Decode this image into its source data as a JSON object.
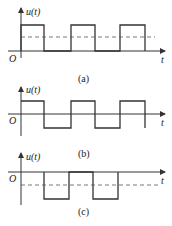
{
  "figure": {
    "panels": [
      {
        "id": "a",
        "caption": "(a)",
        "y_label": "u(t)",
        "x_label": "t",
        "origin_label": "O",
        "description": "Unipolar rectangular pulse train above zero; dashed line shows positive DC (average) level",
        "waveform": "pulses from 0 to +A",
        "dashed_level": "positive average"
      },
      {
        "id": "b",
        "caption": "(b)",
        "y_label": "u(t)",
        "x_label": "t",
        "origin_label": "O",
        "description": "Bipolar square wave alternating between +A and -A with zero average",
        "waveform": "square wave +A / -A",
        "dashed_level": "none"
      },
      {
        "id": "c",
        "caption": "(c)",
        "y_label": "u(t)",
        "x_label": "t",
        "origin_label": "O",
        "description": "Negative rectangular pulse train below zero; dashed line shows negative DC (average) level",
        "waveform": "pulses from 0 to -A",
        "dashed_level": "negative average"
      }
    ],
    "colors": {
      "line": "#333333",
      "dashed": "#555555",
      "background": "#ffffff"
    }
  }
}
